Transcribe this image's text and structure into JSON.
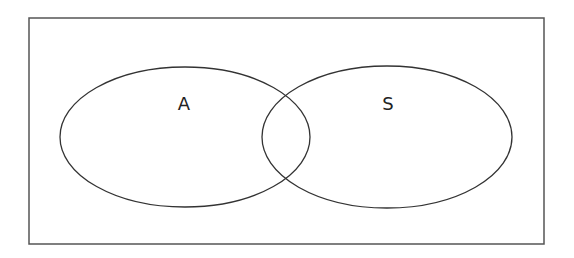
{
  "diagram": {
    "type": "venn",
    "frame": {
      "x": 29,
      "y": 18,
      "width": 515,
      "height": 226,
      "stroke": "#555555"
    },
    "sets": [
      {
        "label": "A",
        "cx": 185,
        "cy": 137,
        "rx": 125,
        "ry": 70,
        "label_x": 184,
        "label_y": 110
      },
      {
        "label": "S",
        "cx": 387,
        "cy": 137,
        "rx": 125,
        "ry": 71,
        "label_x": 388,
        "label_y": 110
      }
    ],
    "stroke_color": "#333333"
  }
}
